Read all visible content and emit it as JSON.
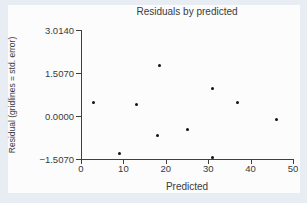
{
  "chart_data": {
    "type": "scatter",
    "title": "Residuals by predicted",
    "xlabel": "Predicted",
    "ylabel": "Residual (gridlines = std. error)",
    "xlim": [
      0,
      50
    ],
    "ylim": [
      -1.507,
      3.014
    ],
    "grid": false,
    "legend": false,
    "x_ticks": [
      {
        "value": 0,
        "label": "0"
      },
      {
        "value": 10,
        "label": "10"
      },
      {
        "value": 20,
        "label": "20"
      },
      {
        "value": 30,
        "label": "30"
      },
      {
        "value": 40,
        "label": "40"
      },
      {
        "value": 50,
        "label": "50"
      }
    ],
    "y_ticks": [
      {
        "value": 3.014,
        "label": "3.0140"
      },
      {
        "value": 1.507,
        "label": "1.5070"
      },
      {
        "value": 0,
        "label": "0.0000"
      },
      {
        "value": -1.507,
        "label": "−1.5070"
      }
    ],
    "points": [
      {
        "x": 3,
        "y": 0.47
      },
      {
        "x": 9,
        "y": -1.31
      },
      {
        "x": 13,
        "y": 0.41
      },
      {
        "x": 18.5,
        "y": 1.76
      },
      {
        "x": 18,
        "y": -0.7
      },
      {
        "x": 25,
        "y": -0.49
      },
      {
        "x": 31,
        "y": 0.95
      },
      {
        "x": 31,
        "y": -1.45
      },
      {
        "x": 37,
        "y": 0.48
      },
      {
        "x": 46,
        "y": -0.12
      }
    ]
  },
  "colors": {
    "page_background": "#e7edf2",
    "card_background": "#fcfcfc",
    "axis": "#3f3f3f",
    "text": "#3a3a3a",
    "marker": "#111111"
  }
}
